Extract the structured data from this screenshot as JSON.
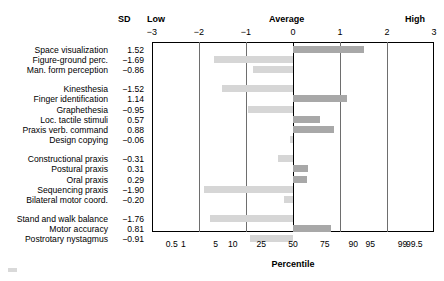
{
  "header": {
    "sd_column_label": "SD",
    "low_label": "Low",
    "average_label": "Average",
    "high_label": "High"
  },
  "axis_title": "Percentile",
  "chart_data": {
    "type": "bar",
    "orientation": "horizontal",
    "title": "",
    "xlabel": "Percentile",
    "ylabel": "",
    "xlim": [
      -3,
      3
    ],
    "grid": true,
    "value_column_header": "SD",
    "zone_labels": [
      "Low",
      "Average",
      "High"
    ],
    "top_axis": {
      "name": "SD",
      "ticks": [
        -3,
        -2,
        -1,
        0,
        1,
        2,
        3
      ],
      "tick_labels": [
        "−3",
        "−2",
        "−1",
        "0",
        "1",
        "2",
        "3"
      ]
    },
    "bottom_axis": {
      "name": "Percentile",
      "tick_labels": [
        "0.5",
        "1",
        "5",
        "10",
        "25",
        "50",
        "75",
        "90",
        "95",
        "99",
        "99.5"
      ],
      "tick_sd_positions": [
        -2.58,
        -2.33,
        -1.645,
        -1.28,
        -0.674,
        0,
        0.674,
        1.28,
        1.645,
        2.33,
        2.58
      ]
    },
    "groups": [
      {
        "items": [
          {
            "label": "Space visualization",
            "value": 1.52,
            "value_text": "1.52"
          },
          {
            "label": "Figure-ground perc.",
            "value": -1.69,
            "value_text": "−1.69"
          },
          {
            "label": "Man. form perception",
            "value": -0.86,
            "value_text": "−0.86"
          }
        ]
      },
      {
        "items": [
          {
            "label": "Kinesthesia",
            "value": -1.52,
            "value_text": "−1.52"
          },
          {
            "label": "Finger identification",
            "value": 1.14,
            "value_text": "1.14"
          },
          {
            "label": "Graphethesia",
            "value": -0.95,
            "value_text": "−0.95"
          },
          {
            "label": "Loc. tactile stimuli",
            "value": 0.57,
            "value_text": "0.57"
          },
          {
            "label": "Praxis verb. command",
            "value": 0.88,
            "value_text": "0.88"
          },
          {
            "label": "Design copying",
            "value": -0.06,
            "value_text": "−0.06"
          }
        ]
      },
      {
        "items": [
          {
            "label": "Constructional praxis",
            "value": -0.31,
            "value_text": "−0.31"
          },
          {
            "label": "Postural praxis",
            "value": 0.31,
            "value_text": "0.31"
          },
          {
            "label": "Oral praxis",
            "value": 0.29,
            "value_text": "0.29"
          },
          {
            "label": "Sequencing praxis",
            "value": -1.9,
            "value_text": "−1.90"
          },
          {
            "label": "Bilateral motor coord.",
            "value": -0.2,
            "value_text": "−0.20"
          }
        ]
      },
      {
        "items": [
          {
            "label": "Stand and walk balance",
            "value": -1.76,
            "value_text": "−1.76"
          },
          {
            "label": "Motor accuracy",
            "value": 0.81,
            "value_text": "0.81"
          },
          {
            "label": "Postrotary nystagmus",
            "value": -0.91,
            "value_text": "−0.91"
          }
        ]
      }
    ],
    "colors": {
      "positive_bar": "#a8a8a8",
      "negative_bar": "#d6d6d6",
      "gridline": "#6e6e6e",
      "frame": "#000000"
    }
  }
}
